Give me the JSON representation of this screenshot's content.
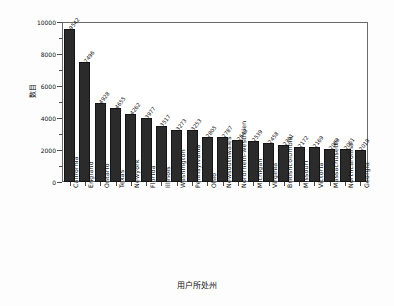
{
  "chart_data": {
    "type": "bar",
    "title": "",
    "xlabel": "用户所处州",
    "ylabel": "数目",
    "ylim": [
      0,
      10000
    ],
    "yticks": [
      0,
      2000,
      4000,
      6000,
      8000,
      10000
    ],
    "grid": false,
    "legend": "none",
    "bar_color": "#2b2b2b",
    "categories": [
      "California",
      "England",
      "Ontario",
      "Texas",
      "Newyork",
      "Florida",
      "Illinois",
      "Washington",
      "Pennsylvania",
      "Ohio",
      "Newsouthwales",
      "Nordrhein-westfalen",
      "Michigan",
      "Virginia",
      "Britishcolumbia",
      "Missouri",
      "Victoria",
      "Massachusetts",
      "Northcarolina",
      "Georgia"
    ],
    "values": [
      9542,
      7496,
      4928,
      4655,
      4262,
      3977,
      3517,
      3273,
      3253,
      2805,
      2787,
      2643,
      2539,
      2458,
      2301,
      2172,
      2169,
      2063,
      2061,
      2019
    ],
    "value_labels": [
      "9542",
      "7496",
      "4928",
      "4655",
      "4262",
      "3977",
      "3517",
      "3273",
      "3253",
      "2805",
      "2787",
      "2643",
      "2539",
      "2458",
      "2301",
      "2172",
      "2169",
      "2063",
      "2061",
      "2019"
    ]
  }
}
